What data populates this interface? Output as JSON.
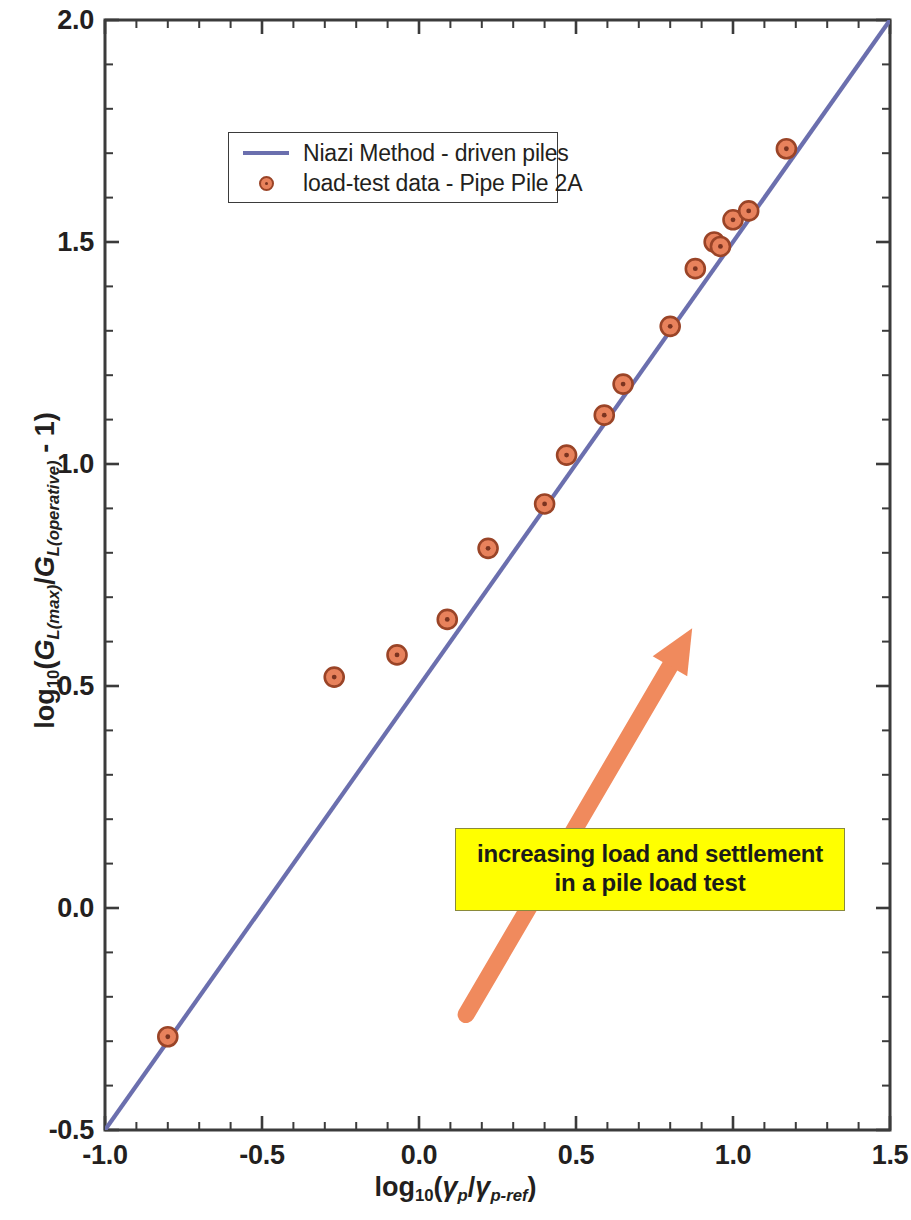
{
  "chart_data": {
    "type": "scatter",
    "title": "",
    "subtitle": "",
    "xlabel": "log10(γp/γp-ref)",
    "ylabel": "log10(GL(max)/GL(operative) - 1)",
    "xlim": [
      -1.0,
      1.5
    ],
    "ylim": [
      -0.5,
      2.0
    ],
    "xticks": [
      "-1.0",
      "-0.5",
      "0.0",
      "0.5",
      "1.0",
      "1.5"
    ],
    "xtick_values": [
      -1.0,
      -0.5,
      0.0,
      0.5,
      1.0,
      1.5
    ],
    "yticks": [
      "-0.5",
      "0.0",
      "0.5",
      "1.0",
      "1.5",
      "2.0"
    ],
    "ytick_values": [
      -0.5,
      0.0,
      0.5,
      1.0,
      1.5,
      2.0
    ],
    "minor_tick_interval": 0.1,
    "grid": false,
    "legend_position": "upper-left-inside",
    "series": [
      {
        "name": "Niazi Method - driven piles",
        "type": "line",
        "color": "#6b6fae",
        "x": [
          -1.0,
          1.5
        ],
        "y": [
          -0.5,
          2.0
        ]
      },
      {
        "name": "load-test data - Pipe Pile 2A",
        "type": "scatter",
        "marker": "circle-dot",
        "face_color": "#e8825c",
        "edge_color": "#9a4427",
        "points": [
          [
            -0.8,
            -0.29
          ],
          [
            -0.27,
            0.52
          ],
          [
            -0.07,
            0.57
          ],
          [
            0.09,
            0.65
          ],
          [
            0.22,
            0.81
          ],
          [
            0.4,
            0.91
          ],
          [
            0.47,
            1.02
          ],
          [
            0.59,
            1.11
          ],
          [
            0.65,
            1.18
          ],
          [
            0.8,
            1.31
          ],
          [
            0.88,
            1.44
          ],
          [
            0.94,
            1.5
          ],
          [
            0.96,
            1.49
          ],
          [
            1.0,
            1.55
          ],
          [
            1.05,
            1.57
          ],
          [
            1.17,
            1.71
          ]
        ]
      }
    ],
    "annotations": [
      {
        "name": "increasing-load-callout",
        "text_lines": [
          "increasing load and settlement",
          "in a pile load test"
        ],
        "background_color": "#ffff00",
        "border_color": "#8a8a3a",
        "arrow": {
          "color": "#f08a5d",
          "from": [
            0.15,
            -0.24
          ],
          "to": [
            0.87,
            0.63
          ],
          "direction": "up-right"
        }
      }
    ]
  },
  "legend": {
    "items": [
      {
        "label": "Niazi Method - driven piles",
        "key": "line-swatch"
      },
      {
        "label": "load-test data - Pipe Pile 2A",
        "key": "marker-swatch"
      }
    ]
  },
  "annotation": {
    "line1": "increasing load and settlement",
    "line2": "in a pile load test"
  },
  "axes": {
    "x": {
      "ticks": [
        "-1.0",
        "-0.5",
        "0.0",
        "0.5",
        "1.0",
        "1.5"
      ]
    },
    "y": {
      "ticks": [
        "2.0",
        "1.5",
        "1.0",
        "0.5",
        "0.0",
        "-0.5"
      ]
    }
  },
  "colors": {
    "line": "#6b6fae",
    "marker_face": "#e8825c",
    "marker_edge": "#9a4427",
    "arrow": "#f08a5d",
    "callout_bg": "#ffff00",
    "axis": "#3b3b3b"
  }
}
